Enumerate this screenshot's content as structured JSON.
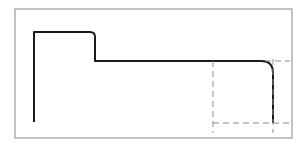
{
  "diagram": {
    "type": "stepped-profile-drawing",
    "colors": {
      "background": "#ffffff",
      "frame": "#9a9a9a",
      "profile": "#1a1a1a",
      "construction": "#8a8a8a"
    },
    "frame": {
      "x": 15,
      "y": 9,
      "width": 277,
      "height": 129
    },
    "profile": {
      "left_x": 34,
      "bottom_y": 122,
      "top_y": 32,
      "step_x": 95,
      "step_y": 61,
      "right_x": 273,
      "right_bottom_y": 123,
      "step_corner_radius": 5,
      "right_corner_radius": 12
    },
    "detail_box": {
      "left_x": 213,
      "right_x": 273,
      "top_y": 61,
      "bottom_y": 123,
      "extend_right_to": 290,
      "extend_bottom_to": 133,
      "style": "dashed"
    }
  }
}
